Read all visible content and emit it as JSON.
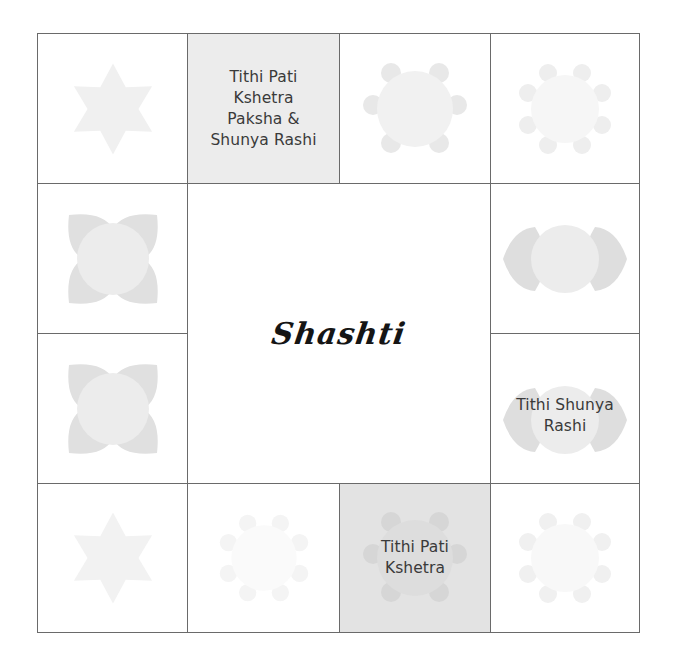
{
  "chart": {
    "title": "Shashti",
    "colors": {
      "border": "#6a6a6a",
      "highlight_top": "#ececec",
      "highlight_bottom": "#e3e3e3",
      "shape_light": "#f2f2f2",
      "shape_mid": "#e2e2e2",
      "text": "#3a3a3a"
    }
  },
  "cells": {
    "r1c1": {
      "shape": "six-point-star-icon",
      "label": ""
    },
    "r1c2": {
      "shape": "",
      "label_lines": [
        "Tithi Pati",
        "Kshetra",
        "Paksha &",
        "Shunya Rashi"
      ],
      "highlighted": true
    },
    "r1c3": {
      "shape": "eight-petal-lotus-icon",
      "label": ""
    },
    "r1c4": {
      "shape": "ten-petal-rosette-icon",
      "label": ""
    },
    "r2c1": {
      "shape": "four-petal-lotus-icon",
      "label": ""
    },
    "r2c4": {
      "shape": "two-petal-lotus-icon",
      "label": ""
    },
    "r3c1": {
      "shape": "four-petal-lotus-icon",
      "label": ""
    },
    "r3c4": {
      "shape": "two-petal-lotus-icon",
      "label_lines": [
        "Tithi Shunya",
        "Rashi"
      ]
    },
    "r4c1": {
      "shape": "six-point-star-icon",
      "label": ""
    },
    "r4c2": {
      "shape": "ten-petal-rosette-icon",
      "label": ""
    },
    "r4c3": {
      "shape": "eight-petal-lotus-icon",
      "label_lines": [
        "Tithi Pati",
        "Kshetra"
      ],
      "highlighted": true
    },
    "r4c4": {
      "shape": "ten-petal-rosette-icon",
      "label": ""
    }
  }
}
